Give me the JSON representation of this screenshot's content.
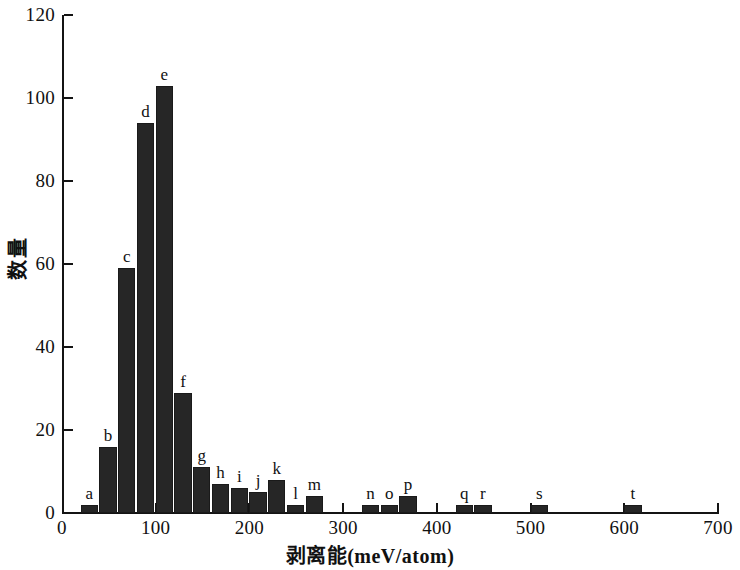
{
  "chart_data": {
    "type": "bar",
    "title": "",
    "subtitle": "",
    "xlabel": "剥离能(meV/atom)",
    "ylabel": "数量",
    "xlim": [
      0,
      700
    ],
    "ylim": [
      0,
      120
    ],
    "xticks": [
      0,
      100,
      200,
      300,
      400,
      500,
      600,
      700
    ],
    "xtick_labels": [
      "0",
      "100",
      "200",
      "300",
      "400",
      "500",
      "600",
      "700"
    ],
    "yticks": [
      0,
      20,
      40,
      60,
      80,
      100,
      120
    ],
    "ytick_labels": [
      "0",
      "20",
      "40",
      "60",
      "80",
      "100",
      "120"
    ],
    "grid": false,
    "legend": null,
    "bar_color": "#262626",
    "bin_width": 20,
    "categories": [
      "a",
      "b",
      "c",
      "d",
      "e",
      "f",
      "g",
      "h",
      "i",
      "j",
      "k",
      "l",
      "m",
      "n",
      "o",
      "p",
      "q",
      "r",
      "s",
      "t"
    ],
    "bin_starts": [
      20,
      40,
      60,
      80,
      100,
      120,
      140,
      160,
      180,
      200,
      220,
      240,
      260,
      320,
      340,
      360,
      420,
      440,
      500,
      600
    ],
    "values": [
      2,
      16,
      59,
      94,
      103,
      29,
      11,
      7,
      6,
      5,
      8,
      2,
      4,
      2,
      2,
      4,
      2,
      2,
      2,
      2
    ],
    "bars": [
      {
        "label": "a",
        "bin_start": 20,
        "bin_end": 40,
        "value": 2
      },
      {
        "label": "b",
        "bin_start": 40,
        "bin_end": 60,
        "value": 16
      },
      {
        "label": "c",
        "bin_start": 60,
        "bin_end": 80,
        "value": 59
      },
      {
        "label": "d",
        "bin_start": 80,
        "bin_end": 100,
        "value": 94
      },
      {
        "label": "e",
        "bin_start": 100,
        "bin_end": 120,
        "value": 103
      },
      {
        "label": "f",
        "bin_start": 120,
        "bin_end": 140,
        "value": 29
      },
      {
        "label": "g",
        "bin_start": 140,
        "bin_end": 160,
        "value": 11
      },
      {
        "label": "h",
        "bin_start": 160,
        "bin_end": 180,
        "value": 7
      },
      {
        "label": "i",
        "bin_start": 180,
        "bin_end": 200,
        "value": 6
      },
      {
        "label": "j",
        "bin_start": 200,
        "bin_end": 220,
        "value": 5
      },
      {
        "label": "k",
        "bin_start": 220,
        "bin_end": 240,
        "value": 8
      },
      {
        "label": "l",
        "bin_start": 240,
        "bin_end": 260,
        "value": 2
      },
      {
        "label": "m",
        "bin_start": 260,
        "bin_end": 280,
        "value": 4
      },
      {
        "label": "n",
        "bin_start": 320,
        "bin_end": 340,
        "value": 2
      },
      {
        "label": "o",
        "bin_start": 340,
        "bin_end": 360,
        "value": 2
      },
      {
        "label": "p",
        "bin_start": 360,
        "bin_end": 380,
        "value": 4
      },
      {
        "label": "q",
        "bin_start": 420,
        "bin_end": 440,
        "value": 2
      },
      {
        "label": "r",
        "bin_start": 440,
        "bin_end": 460,
        "value": 2
      },
      {
        "label": "s",
        "bin_start": 500,
        "bin_end": 520,
        "value": 2
      },
      {
        "label": "t",
        "bin_start": 600,
        "bin_end": 620,
        "value": 2
      }
    ]
  }
}
